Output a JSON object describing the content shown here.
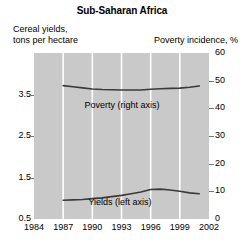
{
  "title": "Sub-Saharan Africa",
  "axis_captions": {
    "left_line1": "Cereal yields,",
    "left_line2": "tons per hectare",
    "right": "Poverty incidence, %"
  },
  "colors": {
    "plot_background": "#c9c9c9",
    "gridline": "#ffffff",
    "line": "#3a3a3a",
    "tick": "#777777",
    "text": "#000000",
    "page_background": "#ffffff"
  },
  "chart_data": {
    "type": "line",
    "title": "Sub-Saharan Africa",
    "xlabel": "",
    "ylabel": "Cereal yields, tons per hectare",
    "y2label": "Poverty incidence, %",
    "grid": "vertical",
    "legend": "inline-annotations",
    "xlim": [
      1984,
      2002
    ],
    "ylim": [
      0.5,
      4.5
    ],
    "y2lim": [
      0,
      60
    ],
    "xticks": [
      1984,
      1987,
      1990,
      1993,
      1996,
      1999,
      2002
    ],
    "xticklabels": [
      "1984",
      "1987",
      "1990",
      "1993",
      "1996",
      "1999",
      "2002"
    ],
    "yticks": [
      0.5,
      1.5,
      2.5,
      3.5
    ],
    "yticklabels": [
      "0.5",
      "1.5",
      "2.5",
      "3.5"
    ],
    "y2ticks": [
      0,
      10,
      20,
      30,
      40,
      50,
      60
    ],
    "y2ticklabels": [
      "0",
      "10",
      "20",
      "30",
      "40",
      "50",
      "60"
    ],
    "x": [
      1987,
      1988,
      1989,
      1990,
      1991,
      1992,
      1993,
      1994,
      1995,
      1996,
      1997,
      1998,
      1999,
      2000,
      2001
    ],
    "series": [
      {
        "name": "Poverty (right axis)",
        "axis": "right",
        "annotation": "Poverty (right axis)",
        "values": [
          48.2,
          47.8,
          47.4,
          47.0,
          46.8,
          46.7,
          46.6,
          46.6,
          46.6,
          46.9,
          47.1,
          47.2,
          47.3,
          47.6,
          48.1
        ]
      },
      {
        "name": "Yields (left axis)",
        "axis": "left",
        "annotation": "Yields (left axis)",
        "values": [
          0.95,
          0.96,
          0.97,
          0.99,
          1.01,
          1.04,
          1.07,
          1.11,
          1.15,
          1.21,
          1.22,
          1.2,
          1.17,
          1.13,
          1.11
        ]
      }
    ]
  }
}
